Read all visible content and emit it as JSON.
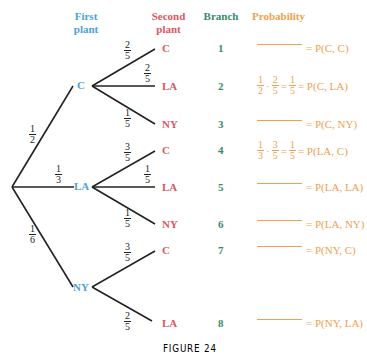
{
  "headers": {
    "first_plant": [
      "First",
      "plant"
    ],
    "second_plant": [
      "Second",
      "plant"
    ],
    "branch": "Branch",
    "probability": "Probability"
  },
  "colors": {
    "first_plant": "#4aa3d8",
    "second_plant": "#e0555f",
    "branch": "#3a8a6a",
    "probability": "#f0a050",
    "lines": "#222222"
  },
  "first_level": [
    {
      "label": "C",
      "prob": {
        "num": "1",
        "den": "2"
      }
    },
    {
      "label": "LA",
      "prob": {
        "num": "1",
        "den": "3"
      }
    },
    {
      "label": "NY",
      "prob": {
        "num": "1",
        "den": "6"
      }
    }
  ],
  "second_level": [
    {
      "parent": "C",
      "label": "C",
      "prob": {
        "num": "2",
        "den": "5"
      },
      "branch": "1",
      "probability": {
        "calc": null,
        "result": "= P(C, C)"
      }
    },
    {
      "parent": "C",
      "label": "LA",
      "prob": {
        "num": "2",
        "den": "5"
      },
      "branch": "2",
      "probability": {
        "calc": "1/2 · 2/5 = 1/5",
        "result": "= P(C, LA)"
      }
    },
    {
      "parent": "C",
      "label": "NY",
      "prob": {
        "num": "1",
        "den": "5"
      },
      "branch": "3",
      "probability": {
        "calc": null,
        "result": "= P(C, NY)"
      }
    },
    {
      "parent": "LA",
      "label": "C",
      "prob": {
        "num": "3",
        "den": "5"
      },
      "branch": "4",
      "probability": {
        "calc": "1/3 · 3/5 = 1/5",
        "result": "= P(LA, C)"
      }
    },
    {
      "parent": "LA",
      "label": "LA",
      "prob": {
        "num": "1",
        "den": "5"
      },
      "branch": "5",
      "probability": {
        "calc": null,
        "result": "= P(LA, LA)"
      }
    },
    {
      "parent": "LA",
      "label": "NY",
      "prob": {
        "num": "1",
        "den": "5"
      },
      "branch": "6",
      "probability": {
        "calc": null,
        "result": "= P(LA, NY)"
      }
    },
    {
      "parent": "NY",
      "label": "C",
      "prob": {
        "num": "3",
        "den": "5"
      },
      "branch": "7",
      "probability": {
        "calc": null,
        "result": "= P(NY, C)"
      }
    },
    {
      "parent": "NY",
      "label": "LA",
      "prob": {
        "num": "2",
        "den": "5"
      },
      "branch": "8",
      "probability": {
        "calc": null,
        "result": "= P(NY, LA)"
      }
    }
  ],
  "caption": "FIGURE 24"
}
